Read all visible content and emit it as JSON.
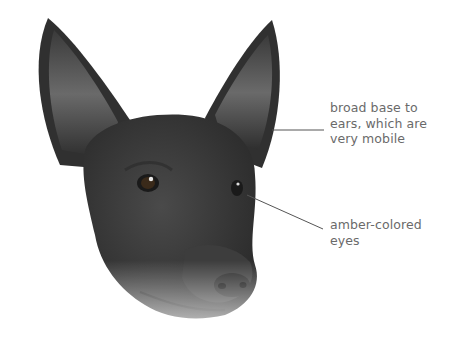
{
  "figure": {
    "callouts": [
      {
        "id": "ears",
        "lines": [
          "broad base to",
          "ears, which are",
          "very mobile"
        ]
      },
      {
        "id": "eyes",
        "lines": [
          "amber-colored",
          "eyes"
        ]
      }
    ],
    "colors": {
      "background": "#ffffff",
      "label_text": "#6a6a6a",
      "leader_line": "#555555"
    }
  }
}
